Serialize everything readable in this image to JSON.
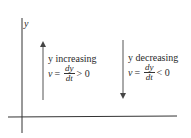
{
  "axes": {
    "y_label": "y"
  },
  "left_case": {
    "title": "y increasing",
    "var": "v",
    "equals": "=",
    "numerator": "dy",
    "denominator": "dt",
    "relation": "> 0",
    "arrow_direction": "up"
  },
  "right_case": {
    "title": "y decreasing",
    "var": "v",
    "equals": "=",
    "numerator": "dy",
    "denominator": "dt",
    "relation": "< 0",
    "arrow_direction": "down"
  }
}
